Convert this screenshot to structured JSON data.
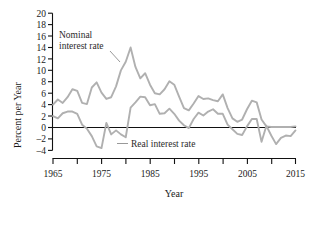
{
  "chart_data": {
    "type": "line",
    "title": "",
    "xlabel": "Year",
    "ylabel": "Percent per Year",
    "xlim": [
      1965,
      2015
    ],
    "ylim": [
      -4,
      20
    ],
    "grid": false,
    "legend": "inline-annotations",
    "x_ticks_major": [
      1965,
      1975,
      1985,
      1995,
      2005,
      2015
    ],
    "x_ticks_minor": [
      1970,
      1980,
      1990,
      2000,
      2010
    ],
    "y_ticks": [
      -4,
      -2,
      0,
      2,
      4,
      6,
      8,
      10,
      12,
      14,
      16,
      18,
      20
    ],
    "zero_reference_line": 0,
    "series_color": "#b0b0b0",
    "axis_color": "#111111",
    "x": [
      1965,
      1966,
      1967,
      1968,
      1969,
      1970,
      1971,
      1972,
      1973,
      1974,
      1975,
      1976,
      1977,
      1978,
      1979,
      1980,
      1981,
      1982,
      1983,
      1984,
      1985,
      1986,
      1987,
      1988,
      1989,
      1990,
      1991,
      1992,
      1993,
      1994,
      1995,
      1996,
      1997,
      1998,
      1999,
      2000,
      2001,
      2002,
      2003,
      2004,
      2005,
      2006,
      2007,
      2008,
      2009,
      2010,
      2011,
      2012,
      2013,
      2014,
      2015
    ],
    "series": [
      {
        "name": "Nominal interest rate",
        "label_x": 1972,
        "label_y": 16.2,
        "values": [
          4.0,
          4.9,
          4.3,
          5.3,
          6.7,
          6.4,
          4.3,
          4.1,
          7.0,
          7.9,
          6.1,
          5.0,
          5.3,
          7.2,
          10.0,
          11.5,
          14.0,
          10.6,
          8.6,
          9.5,
          7.5,
          6.0,
          5.8,
          6.7,
          8.1,
          7.5,
          5.4,
          3.4,
          3.0,
          4.2,
          5.5,
          5.0,
          5.1,
          4.8,
          4.6,
          5.8,
          3.4,
          1.6,
          1.0,
          1.4,
          3.2,
          4.7,
          4.4,
          1.4,
          0.2,
          0.1,
          0.1,
          0.1,
          0.1,
          0.1,
          0.2
        ]
      },
      {
        "name": "Real interest rate",
        "label_x": 1983,
        "label_y": -2.5,
        "values": [
          2.0,
          1.6,
          2.5,
          2.8,
          2.8,
          2.4,
          0.5,
          -0.2,
          -1.5,
          -3.3,
          -3.6,
          0.8,
          -1.2,
          -0.5,
          -1.2,
          -1.7,
          3.5,
          4.4,
          5.4,
          5.3,
          3.9,
          4.1,
          2.4,
          2.5,
          3.3,
          2.4,
          1.2,
          0.4,
          -0.1,
          1.5,
          2.6,
          2.1,
          2.8,
          3.2,
          2.4,
          2.4,
          0.5,
          -0.3,
          -1.1,
          -1.3,
          0.2,
          1.5,
          1.5,
          -2.5,
          0.3,
          -1.4,
          -2.9,
          -1.8,
          -1.4,
          -1.5,
          -0.5
        ]
      }
    ],
    "annotations": [
      {
        "text_line1": "Nominal",
        "text_line2": "interest rate"
      },
      {
        "text": "Real interest rate"
      }
    ]
  },
  "labels": {
    "y_axis_title": "Percent per Year",
    "x_axis_title": "Year",
    "nominal_line1": "Nominal",
    "nominal_line2": "interest rate",
    "real": "Real interest rate",
    "y_4": "20",
    "y_3": "18",
    "y_2": "16",
    "y_1": "14",
    "y_0": "12",
    "ya": "10",
    "yb": "8",
    "yc": "6",
    "yd": "4",
    "ye": "2",
    "yf": "0",
    "yg": "–2",
    "yh": "–4",
    "x_1965": "1965",
    "x_1975": "1975",
    "x_1985": "1985",
    "x_1995": "1995",
    "x_2005": "2005",
    "x_2015": "2015"
  }
}
